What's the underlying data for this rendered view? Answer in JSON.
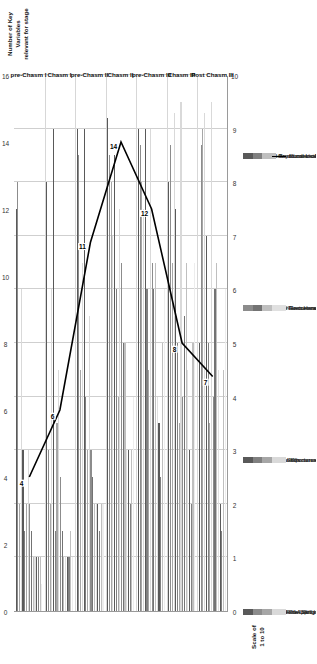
{
  "chart_data": {
    "type": "bar",
    "title": "",
    "xlabel": "",
    "ylabel": "Scale of\n1 to 10",
    "y2label": "Number of Key\nVariables\nrelevant for stage",
    "categories": [
      "pre-Chasm I",
      "Chasm I",
      "pre-Chasm II",
      "Chasm II",
      "pre-Chasm III",
      "Chasm III",
      "Post Chasm III"
    ],
    "ylim": [
      0,
      10
    ],
    "yticks": [
      0,
      1,
      2,
      3,
      4,
      5,
      6,
      7,
      8,
      9,
      10
    ],
    "y2lim": [
      0,
      16
    ],
    "y2ticks": [
      0,
      2,
      4,
      6,
      8,
      10,
      12,
      14,
      16
    ],
    "grid": true,
    "legend_position": "bottom",
    "series": [
      {
        "name": "Entrepreneurial Skill Intensity",
        "color": "#595959",
        "values": [
          7.5,
          8.0,
          9.0,
          9.2,
          9.0,
          8.0,
          5.0
        ]
      },
      {
        "name": "Team Role Clarity",
        "color": "#8c8c8c",
        "values": [
          8.0,
          3.0,
          8.5,
          8.5,
          8.7,
          8.7,
          8.7
        ]
      },
      {
        "name": "Hybrid Approaches to Leadership",
        "color": "#a6a6a6",
        "values": [
          2.0,
          2.0,
          4.5,
          8.0,
          8.0,
          6.5,
          9.0
        ]
      },
      {
        "name": "Prevailing Culture",
        "color": "#d9d9d9",
        "values": [
          6.0,
          6.0,
          6.5,
          7.0,
          7.5,
          9.3,
          9.3
        ]
      },
      {
        "name": "Synthesis Skills",
        "color": "#595959",
        "values": [
          3.0,
          9.0,
          9.0,
          8.5,
          9.0,
          7.5,
          7.0
        ]
      },
      {
        "name": "High-performance team mngt",
        "color": "#808080",
        "values": [
          1.5,
          1.5,
          4.0,
          6.0,
          6.0,
          5.0,
          5.0
        ]
      },
      {
        "name": "Flat Structures based on DAC Paradigm",
        "color": "#a6a6a6",
        "values": [
          2.0,
          3.5,
          3.0,
          4.0,
          4.5,
          3.5,
          3.5
        ]
      },
      {
        "name": "Importance of behaviours",
        "color": "#d9d9d9",
        "values": [
          3.0,
          4.5,
          5.5,
          7.5,
          9.0,
          9.5,
          9.5
        ]
      },
      {
        "name": "Hybrid techno-commercial Skills",
        "color": "#8c8c8c",
        "values": [
          2.0,
          2.5,
          3.0,
          6.5,
          6.5,
          4.0,
          4.0
        ]
      },
      {
        "name": "Virtual Team Handling",
        "color": "#737373",
        "values": [
          1.5,
          1.5,
          2.5,
          5.0,
          6.0,
          5.5,
          6.0
        ]
      },
      {
        "name": "pre-Greiner modes",
        "color": "#bfbfbf",
        "values": [
          1.0,
          1.0,
          2.0,
          5.0,
          6.5,
          6.5,
          6.5
        ]
      },
      {
        "name": "Remuneration and Rewards",
        "color": "#e0e0e0",
        "values": [
          1.0,
          1.0,
          2.0,
          3.0,
          4.0,
          4.5,
          4.5
        ]
      },
      {
        "name": "Use of Psychometric Profiling",
        "color": "#595959",
        "values": [
          1.0,
          1.0,
          2.0,
          3.0,
          3.5,
          3.0,
          2.0
        ]
      },
      {
        "name": "Conventional Leader-Follower paradigm",
        "color": "#808080",
        "values": [
          1.0,
          1.0,
          1.5,
          2.0,
          2.5,
          2.0,
          1.5
        ]
      },
      {
        "name": "Broad consistency with Greiner categories",
        "color": "#bfbfbf",
        "values": [
          1.0,
          1.5,
          2.0,
          3.0,
          5.0,
          5.0,
          4.5
        ]
      },
      {
        "name": "Remuneration tail",
        "color": "#ededed",
        "values": [
          0.5,
          1.0,
          2.0,
          4.0,
          6.0,
          6.5,
          6.0
        ]
      }
    ],
    "line_series": {
      "name": "Number of key variables scoring 5 or more",
      "color": "#000000",
      "values": [
        4,
        6,
        11,
        14,
        12,
        8,
        7
      ],
      "labels": [
        "4",
        "6",
        "11",
        "14",
        "12",
        "8",
        "7"
      ]
    },
    "legend_columns": [
      [
        "Entrepreneurial Skill Intensity",
        "Team Role Clarity",
        "Hybrid Approaches to Leadership",
        "Prevailing Culture"
      ],
      [
        "Synthesis Skills",
        "High-performance team mngt",
        "Flat Structures based on DAC Paradigm",
        "Importance of behaviours"
      ],
      [
        "Hybrid techno-commercial Skills",
        "Virtual Team Handling",
        "pre-Greiner modes",
        "Remuneration and Rewards"
      ],
      [
        "Use of Psychometric Profiling",
        "Conventional Leader-Follower paradigm",
        "Broad consistency with Greiner categories",
        "Number of key variables scoring 5 or more"
      ]
    ],
    "legend_swatch_colors": [
      [
        "#595959",
        "#8c8c8c",
        "#a6a6a6",
        "#d9d9d9"
      ],
      [
        "#595959",
        "#808080",
        "#a6a6a6",
        "#d9d9d9"
      ],
      [
        "#8c8c8c",
        "#737373",
        "#bfbfbf",
        "#e0e0e0"
      ],
      [
        "#595959",
        "#808080",
        "#bfbfbf",
        "line"
      ]
    ]
  }
}
